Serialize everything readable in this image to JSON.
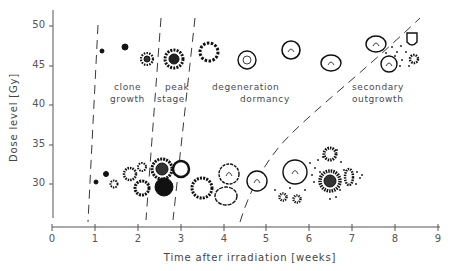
{
  "figure": {
    "x_axis": {
      "title": "Time after irradiation [weeks]",
      "ticks": [
        "0",
        "1",
        "2",
        "3",
        "4",
        "5",
        "6",
        "7",
        "8",
        "9"
      ]
    },
    "y_axis": {
      "title": "Dose level [Gy]",
      "ticks": [
        "50",
        "45",
        "40",
        "35",
        "30"
      ]
    },
    "phases": [
      {
        "line1": "clone",
        "line2": "growth"
      },
      {
        "line1": "peak",
        "line2": "stage"
      },
      {
        "line1": "degeneration",
        "line2": "dormancy"
      },
      {
        "line1": "secondary",
        "line2": "outgrowth"
      }
    ],
    "colors": {
      "ink": "#1a1a1a",
      "text": "#4a4a4a",
      "background": "#ffffff"
    }
  }
}
